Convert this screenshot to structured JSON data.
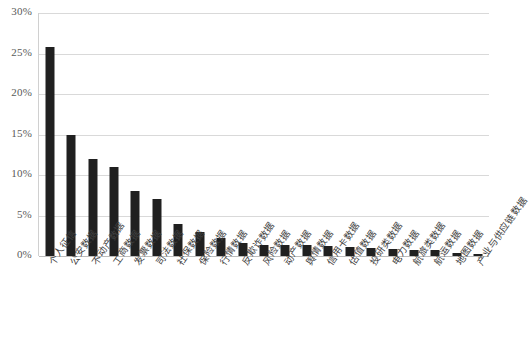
{
  "chart_data": {
    "type": "bar",
    "title": "",
    "subtitle": "",
    "xlabel": "",
    "ylabel": "",
    "ylim": [
      0,
      30
    ],
    "ytick_values": [
      0,
      5,
      10,
      15,
      20,
      25,
      30
    ],
    "ytick_labels": [
      "0%",
      "5%",
      "10%",
      "15%",
      "20%",
      "25%",
      "30%"
    ],
    "grid": true,
    "legend": "none",
    "value_suffix": "%",
    "bar_color": "#202020",
    "grid_color": "#d9d9d9",
    "axis_color": "#bdbdbd",
    "categories": [
      "个人征信",
      "公安数据",
      "不动产数据",
      "工商数据",
      "发票数据",
      "司法数据",
      "社保数据",
      "保险数据",
      "行情数据",
      "反欺诈数据",
      "风险数据",
      "动产数据",
      "舆情数据",
      "信用卡数据",
      "估值数据",
      "投研类数据",
      "电力数据",
      "航旅类数据",
      "航运数据",
      "地图数据",
      "产业与供应链数据"
    ],
    "values": [
      25.8,
      15.0,
      12.0,
      11.0,
      8.0,
      7.0,
      4.0,
      3.0,
      2.2,
      1.6,
      1.4,
      1.4,
      1.3,
      1.2,
      1.1,
      1.0,
      0.9,
      0.8,
      0.8,
      0.4,
      0.2
    ]
  }
}
